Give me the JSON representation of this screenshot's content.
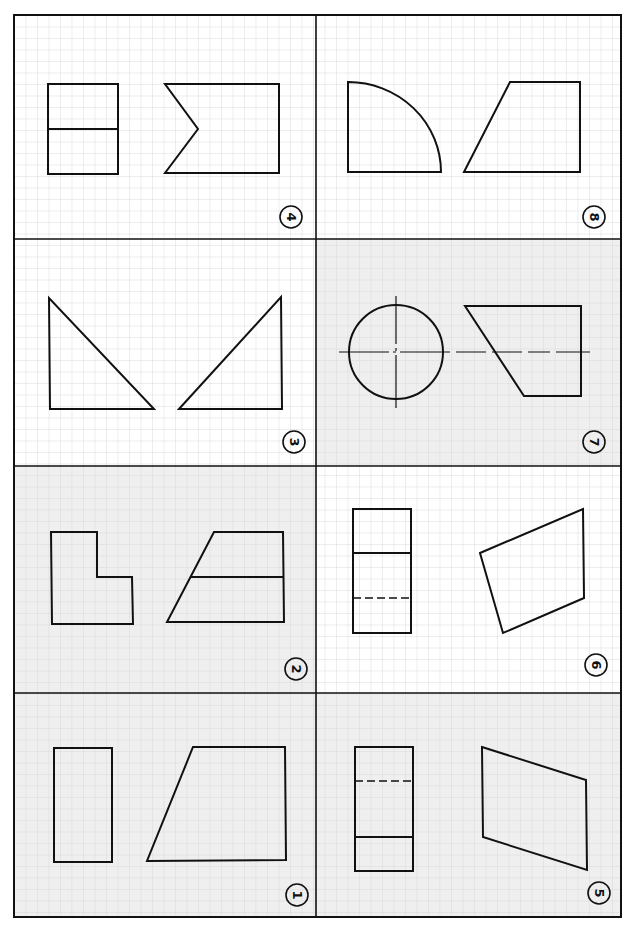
{
  "sheet": {
    "title": "Orthographic projection exercise sheet",
    "frame": {
      "x": 14,
      "y": 15,
      "w": 607,
      "h": 902
    },
    "column_split_x": 316,
    "row_splits_y": [
      239,
      466,
      693
    ],
    "grid_spacing": 11.5,
    "colors": {
      "paper": "#ffffff",
      "tint": "#efefef",
      "grid": "#d4d4d4",
      "ink": "#111111"
    }
  },
  "cells": [
    {
      "id": "4",
      "label": "4",
      "col": 0,
      "row": 0,
      "tinted": false
    },
    {
      "id": "8",
      "label": "8",
      "col": 1,
      "row": 0,
      "tinted": false
    },
    {
      "id": "3",
      "label": "3",
      "col": 0,
      "row": 1,
      "tinted": false
    },
    {
      "id": "7",
      "label": "7",
      "col": 1,
      "row": 1,
      "tinted": true
    },
    {
      "id": "2",
      "label": "2",
      "col": 0,
      "row": 2,
      "tinted": true
    },
    {
      "id": "6",
      "label": "6",
      "col": 1,
      "row": 2,
      "tinted": false
    },
    {
      "id": "1",
      "label": "1",
      "col": 0,
      "row": 3,
      "tinted": true
    },
    {
      "id": "5",
      "label": "5",
      "col": 1,
      "row": 3,
      "tinted": true
    }
  ],
  "labels": {
    "c4": "4",
    "c8": "8",
    "c3": "3",
    "c7": "7",
    "c2": "2",
    "c6": "6",
    "c1": "1",
    "c5": "5"
  }
}
